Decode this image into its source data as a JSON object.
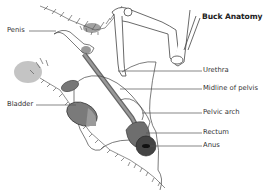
{
  "title": "Buck Anatomy",
  "labels": {
    "penis": "Penis",
    "bladder": "Bladder",
    "urethra": "Urethra",
    "midline": "Midline of pelvis",
    "pelvic_arch": "Pelvic arch",
    "rectum": "Rectum",
    "anus": "Anus"
  },
  "colors": {
    "line": "#555555",
    "organ_dark": "#6a6a6a",
    "organ_mid": "#8a8a8a",
    "organ_light": "#b5b5b5",
    "text": "#333333"
  }
}
